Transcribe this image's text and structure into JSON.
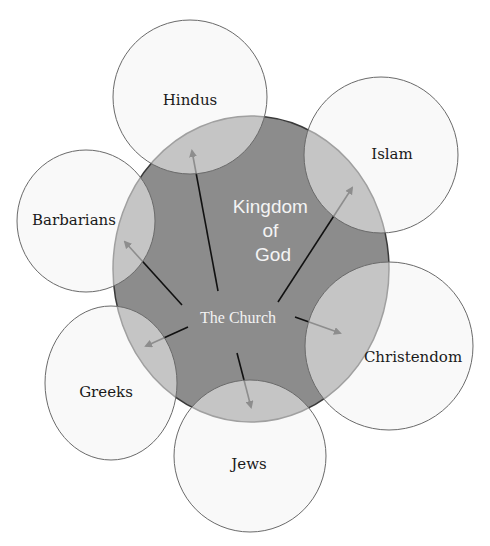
{
  "diagram": {
    "colors": {
      "background": "#ffffff",
      "kingdom_fill": "#8c8c8c",
      "kingdom_stroke": "#3a3a3a",
      "outer_fill": "#f4f4f4",
      "outer_fill_opacity": 0.55,
      "outer_stroke": "#6a6a6a",
      "arrow": "#111111",
      "kingdom_text": "#f4f4f4",
      "outer_text": "#1a1a1a"
    },
    "center": {
      "kingdom_label_lines": [
        "Kingdom",
        "of",
        "God"
      ],
      "church_label": "The Church",
      "ellipse": {
        "cx": 251,
        "cy": 269,
        "rx": 138,
        "ry": 153
      }
    },
    "nodes": [
      {
        "id": "hindus",
        "label": "Hindus",
        "cx": 190,
        "cy": 97,
        "rx": 77,
        "ry": 77,
        "label_x": 190,
        "label_y": 105
      },
      {
        "id": "islam",
        "label": "Islam",
        "cx": 381,
        "cy": 155,
        "rx": 77,
        "ry": 78,
        "label_x": 392,
        "label_y": 159
      },
      {
        "id": "barbarians",
        "label": "Barbarians",
        "cx": 86,
        "cy": 221,
        "rx": 69,
        "ry": 71,
        "label_x": 74,
        "label_y": 225
      },
      {
        "id": "christendom",
        "label": "Christendom",
        "cx": 389,
        "cy": 346,
        "rx": 84,
        "ry": 84,
        "label_x": 413,
        "label_y": 362
      },
      {
        "id": "greeks",
        "label": "Greeks",
        "cx": 111,
        "cy": 383,
        "rx": 66,
        "ry": 77,
        "label_x": 106,
        "label_y": 397
      },
      {
        "id": "jews",
        "label": "Jews",
        "cx": 250,
        "cy": 456,
        "rx": 76,
        "ry": 76,
        "label_x": 249,
        "label_y": 469
      }
    ],
    "arrows": [
      {
        "to": "hindus",
        "x1": 218,
        "y1": 291,
        "x2": 192,
        "y2": 151
      },
      {
        "to": "islam",
        "x1": 278,
        "y1": 302,
        "x2": 352,
        "y2": 188
      },
      {
        "to": "barbarians",
        "x1": 182,
        "y1": 305,
        "x2": 125,
        "y2": 242
      },
      {
        "to": "christendom",
        "x1": 295,
        "y1": 317,
        "x2": 340,
        "y2": 333
      },
      {
        "to": "greeks",
        "x1": 188,
        "y1": 327,
        "x2": 146,
        "y2": 346
      },
      {
        "to": "jews",
        "x1": 237,
        "y1": 353,
        "x2": 251,
        "y2": 407
      }
    ]
  },
  "caption": {
    "visible": "partially cut off at bottom edge"
  }
}
